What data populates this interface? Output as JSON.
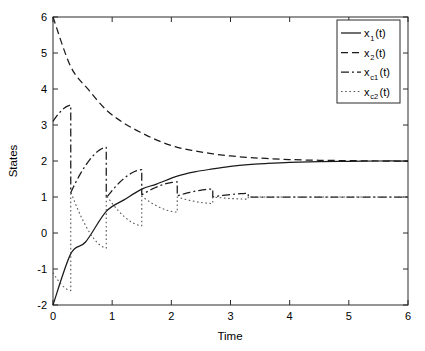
{
  "chart_data": {
    "type": "line",
    "title": "",
    "xlabel": "Time",
    "ylabel": "States",
    "xlim": [
      0,
      6
    ],
    "ylim": [
      -2,
      6
    ],
    "xticks": [
      "0",
      "1",
      "2",
      "3",
      "4",
      "5",
      "6"
    ],
    "yticks": [
      "-2",
      "-1",
      "0",
      "1",
      "2",
      "3",
      "4",
      "5",
      "6"
    ],
    "grid": false,
    "legend_position": "upper right",
    "event_times": [
      0.3,
      0.9,
      1.5,
      2.1,
      2.7,
      3.3
    ],
    "series": [
      {
        "name": "x_1(t)",
        "label_base": "x",
        "label_sub": "1",
        "label_suffix": "(t)",
        "style": "solid",
        "color": "#1a1a1a",
        "converges_to": 2,
        "x": [
          0,
          0.3,
          0.55,
          0.9,
          1.2,
          1.5,
          1.75,
          2.1,
          2.4,
          2.7,
          3.0,
          3.3,
          3.6,
          4.0,
          4.5,
          5.0,
          5.5,
          6.0
        ],
        "y": [
          -2.0,
          -0.58,
          -0.25,
          0.6,
          0.92,
          1.22,
          1.36,
          1.58,
          1.7,
          1.78,
          1.85,
          1.9,
          1.93,
          1.96,
          1.98,
          1.99,
          2.0,
          2.0
        ]
      },
      {
        "name": "x_2(t)",
        "label_base": "x",
        "label_sub": "2",
        "label_suffix": "(t)",
        "style": "dashed",
        "color": "#1a1a1a",
        "converges_to": 2,
        "x": [
          0,
          0.3,
          0.6,
          0.9,
          1.2,
          1.5,
          1.8,
          2.1,
          2.4,
          2.7,
          3.0,
          3.3,
          3.6,
          4.0,
          4.5,
          5.0,
          5.5,
          6.0
        ],
        "y": [
          6.0,
          4.62,
          3.98,
          3.42,
          3.05,
          2.78,
          2.55,
          2.38,
          2.28,
          2.2,
          2.14,
          2.1,
          2.07,
          2.04,
          2.02,
          2.01,
          2.0,
          2.0
        ]
      },
      {
        "name": "x_c1(t)",
        "label_base": "x",
        "label_sub": "c1",
        "label_suffix": "(t)",
        "style": "dashdot",
        "color": "#1a1a1a",
        "converges_to": 1,
        "sawtooth_peaks": [
          3.55,
          2.38,
          1.76,
          1.42,
          1.22,
          1.1
        ],
        "sawtooth_resets": [
          1.12,
          0.97,
          1.06,
          1.03,
          1.0,
          1.0
        ],
        "start_value": 3.1
      },
      {
        "name": "x_c2(t)",
        "label_base": "x",
        "label_sub": "c2",
        "label_suffix": "(t)",
        "style": "dotted",
        "color": "#555555",
        "converges_to": 1,
        "sawtooth_troughs": [
          -1.6,
          -0.42,
          0.2,
          0.58,
          0.82,
          0.94
        ],
        "sawtooth_resets": [
          1.15,
          1.05,
          1.02,
          1.0,
          1.0,
          1.0
        ],
        "start_value": -1.1
      }
    ]
  },
  "axes": {
    "xlabel": "Time",
    "ylabel": "States"
  },
  "legend": {
    "entries": [
      {
        "base": "x",
        "sub": "1",
        "suffix": "(t)",
        "style": "solid"
      },
      {
        "base": "x",
        "sub": "2",
        "suffix": "(t)",
        "style": "dashed"
      },
      {
        "base": "x",
        "sub": "c1",
        "suffix": "(t)",
        "style": "dashdot"
      },
      {
        "base": "x",
        "sub": "c2",
        "suffix": "(t)",
        "style": "dotted"
      }
    ]
  }
}
